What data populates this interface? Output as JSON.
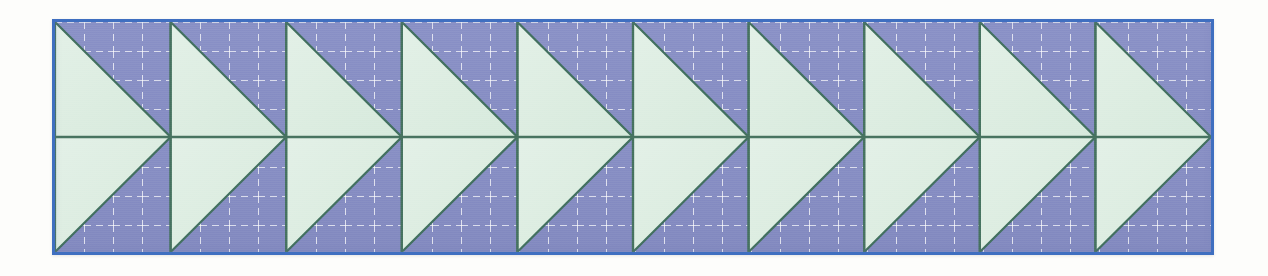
{
  "figure": {
    "kind": "geometric-tessellation-border-strip",
    "repeat_count": 10,
    "canvas": {
      "width": 1268,
      "height": 276,
      "background_color": "#fdfdfb"
    },
    "strip": {
      "x": 52,
      "y": 19,
      "width": 1162,
      "height": 236,
      "border_color": "#3f6fc0",
      "border_width": 3
    },
    "colors": {
      "background_purple": "#8a91c6",
      "background_purple_dark": "#7d85bd",
      "triangle_green": "#ddeee2",
      "triangle_green_light": "#e6f2e9",
      "outline_dark_green": "#42705f",
      "center_line_green": "#47735f",
      "grid_dash_white": "#ffffff",
      "grid_dash_gray": "#6f6f80",
      "frame_blue": "#3f6fc0",
      "paper_white": "#fdfdfb"
    },
    "unit": {
      "label": "flying-geese pair",
      "width": 116,
      "height": 230,
      "shape": "two mirrored right triangles meeting at a point on the horizontal mid-line, forming a right-pointing arrowhead"
    },
    "grid": {
      "visible": true,
      "style": "dashed",
      "cell_size": 29,
      "columns": 40,
      "rows": 8,
      "dash_length": 7,
      "dash_gap": 5
    },
    "geometry_notes": {
      "horizontal_midline_y": 134,
      "triangle_tip_direction": "right",
      "upper_triangle_vertices": "top-left, top-right-of-cell is purple; green fills left edge to tip at mid-right",
      "lower_triangle_vertices": "mirror of upper across the mid-line"
    }
  },
  "chart_data": {
    "type": "table",
    "title": "",
    "categories": [
      "unit-1",
      "unit-2",
      "unit-3",
      "unit-4",
      "unit-5",
      "unit-6",
      "unit-7",
      "unit-8",
      "unit-9",
      "unit-10"
    ],
    "values": [
      116,
      116,
      116,
      116,
      116,
      116,
      116,
      116,
      116,
      116
    ],
    "xlabel": "repeat index",
    "ylabel": "unit width (px)",
    "ylim": [
      0,
      130
    ],
    "grid": true
  }
}
